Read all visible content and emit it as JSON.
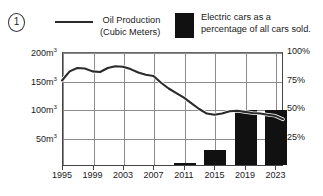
{
  "figure": {
    "marker_label": "1"
  },
  "legend": [
    {
      "key": "line",
      "icon": "line-swatch",
      "line1": "Oil Production",
      "line2": "(Cubic Meters)",
      "color": "#2b2b2b"
    },
    {
      "key": "bar",
      "icon": "square-swatch",
      "line1": "Electric cars as a",
      "line2": "percentage of all cars sold.",
      "color": "#111111"
    }
  ],
  "axes": {
    "left_ticks": [
      {
        "value": 200,
        "label": "200m",
        "unit": "3"
      },
      {
        "value": 150,
        "label": "150m",
        "unit": "3"
      },
      {
        "value": 100,
        "label": "100m",
        "unit": "3"
      },
      {
        "value": 50,
        "label": "50m",
        "unit": "3"
      }
    ],
    "right_ticks": [
      {
        "value": 100,
        "label": "100%"
      },
      {
        "value": 75,
        "label": "75%"
      },
      {
        "value": 50,
        "label": "50%"
      },
      {
        "value": 25,
        "label": "25%"
      }
    ],
    "x_ticks": [
      "1995",
      "1999",
      "2003",
      "2007",
      "2011",
      "2015",
      "2019",
      "2023"
    ]
  },
  "chart_data": {
    "type": "line",
    "title": "",
    "subtitle": "",
    "xlabel": "",
    "ylabel": "Oil Production (Cubic Meters)",
    "y2label": "Electric cars as a percentage of all cars sold.",
    "ylim": [
      0,
      200
    ],
    "y2lim": [
      0,
      100
    ],
    "grid": true,
    "legend_position": "top",
    "x_tick_labels": [
      "1995",
      "1999",
      "2003",
      "2007",
      "2011",
      "2015",
      "2019",
      "2023"
    ],
    "series": [
      {
        "name": "Oil Production (Cubic Meters)",
        "type": "line",
        "axis": "left",
        "unit": "m3",
        "color": "#2b2b2b",
        "x": [
          1995,
          1996,
          1997,
          1998,
          1999,
          2000,
          2001,
          2002,
          2003,
          2004,
          2005,
          2006,
          2007,
          2008,
          2009,
          2010,
          2011,
          2012,
          2013,
          2014,
          2015,
          2016,
          2017,
          2018,
          2019,
          2020,
          2021,
          2022,
          2023,
          2024
        ],
        "values": [
          150,
          166,
          172,
          171,
          166,
          165,
          172,
          175,
          174,
          170,
          164,
          160,
          158,
          146,
          136,
          128,
          120,
          110,
          100,
          92,
          90,
          92,
          96,
          97,
          95,
          93,
          92,
          90,
          88,
          82
        ]
      },
      {
        "name": "Electric cars as a percentage of all cars sold.",
        "type": "bar",
        "axis": "right",
        "unit": "%",
        "color": "#111111",
        "categories": [
          "2011",
          "2015",
          "2019",
          "2023"
        ],
        "values": [
          2,
          13,
          48,
          48
        ]
      }
    ]
  }
}
